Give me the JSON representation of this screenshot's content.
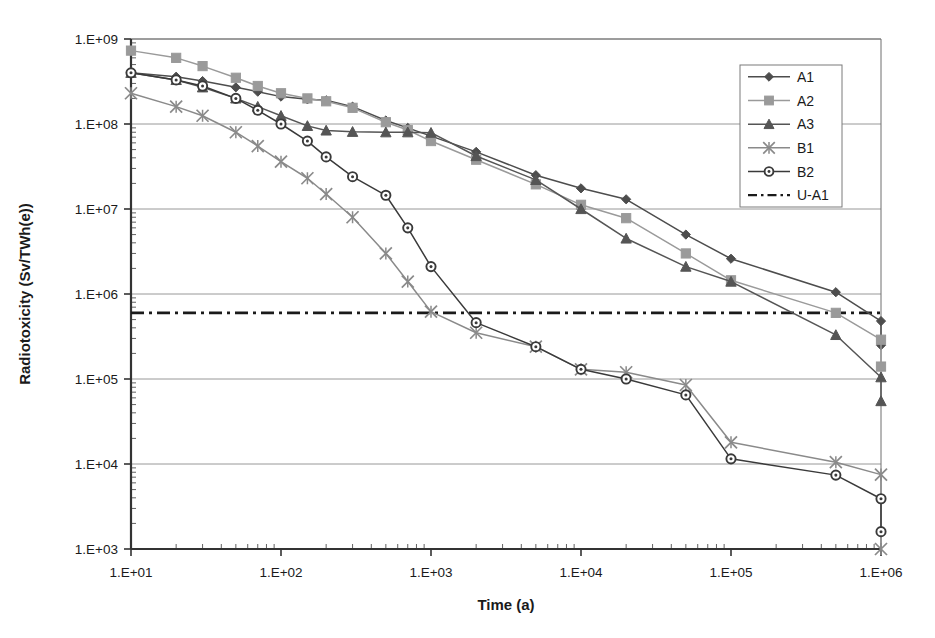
{
  "chart_data": {
    "type": "line",
    "title": "",
    "xlabel": "Time  (a)",
    "ylabel": "Radiotoxicity  (Sv/TWh(e))",
    "xscale": "log",
    "yscale": "log",
    "xlim": [
      10,
      1000000
    ],
    "ylim": [
      1000,
      1000000000
    ],
    "grid": "horizontal-major",
    "legend_position": "top-right-inside",
    "xticklabels": [
      "1.E+01",
      "1.E+02",
      "1.E+03",
      "1.E+04",
      "1.E+05",
      "1.E+06"
    ],
    "xtickvalues": [
      10,
      100,
      1000,
      10000,
      100000,
      1000000
    ],
    "yticklabels": [
      "1.E+03",
      "1.E+04",
      "1.E+05",
      "1.E+06",
      "1.E+07",
      "1.E+08",
      "1.E+09"
    ],
    "ytickvalues": [
      1000,
      10000,
      100000,
      1000000,
      10000000,
      100000000,
      1000000000
    ],
    "series": [
      {
        "name": "A1",
        "marker": "diamond",
        "color": "#4d4d4d",
        "x": [
          10,
          20,
          30,
          50,
          70,
          100,
          150,
          200,
          300,
          500,
          700,
          1000,
          2000,
          5000,
          10000,
          20000,
          50000,
          100000,
          500000,
          1000000
        ],
        "values": [
          400000000.0,
          360000000.0,
          320000000.0,
          270000000.0,
          240000000.0,
          210000000.0,
          195000000.0,
          190000000.0,
          160000000.0,
          110000000.0,
          90000000.0,
          72000000.0,
          47000000.0,
          25000000.0,
          17500000.0,
          13000000.0,
          5000000.0,
          2600000.0,
          1050000.0,
          480000.0
        ],
        "end_value": 250000.0
      },
      {
        "name": "A2",
        "marker": "square",
        "color": "#9a9a9a",
        "x": [
          10,
          20,
          30,
          50,
          70,
          100,
          150,
          200,
          300,
          500,
          700,
          1000,
          2000,
          5000,
          10000,
          20000,
          50000,
          100000,
          500000,
          1000000
        ],
        "values": [
          730000000.0,
          600000000.0,
          480000000.0,
          350000000.0,
          280000000.0,
          230000000.0,
          200000000.0,
          185000000.0,
          155000000.0,
          105000000.0,
          85000000.0,
          63000000.0,
          38000000.0,
          19500000.0,
          11200000.0,
          7800000.0,
          3000000.0,
          1450000.0,
          600000.0,
          290000.0
        ],
        "end_value": 140000.0
      },
      {
        "name": "A3",
        "marker": "triangle",
        "color": "#555555",
        "x": [
          10,
          20,
          30,
          50,
          70,
          100,
          150,
          200,
          300,
          500,
          700,
          1000,
          2000,
          5000,
          10000,
          20000,
          50000,
          100000,
          500000,
          1000000
        ],
        "values": [
          400000000.0,
          330000000.0,
          270000000.0,
          200000000.0,
          160000000.0,
          125000000.0,
          95000000.0,
          84000000.0,
          81000000.0,
          80000000.0,
          80000000.0,
          79000000.0,
          42000000.0,
          22000000.0,
          10000000.0,
          4500000.0,
          2100000.0,
          1400000.0,
          330000.0,
          105000.0
        ],
        "end_value": 55000.0
      },
      {
        "name": "B1",
        "marker": "asterisk",
        "color": "#8a8a8a",
        "x": [
          10,
          20,
          30,
          50,
          70,
          100,
          150,
          200,
          300,
          500,
          700,
          1000,
          2000,
          5000,
          10000,
          20000,
          50000,
          100000,
          500000,
          1000000
        ],
        "values": [
          230000000.0,
          160000000.0,
          125000000.0,
          80000000.0,
          55000000.0,
          36000000.0,
          23000000.0,
          15000000.0,
          8000000.0,
          3000000.0,
          1400000.0,
          620000.0,
          350000.0,
          240000.0,
          130000.0,
          120000.0,
          85000.0,
          18000.0,
          10500.0,
          7500.0
        ],
        "end_value": 1000.0
      },
      {
        "name": "B2",
        "marker": "circle",
        "color": "#3a3a3a",
        "x": [
          10,
          20,
          30,
          50,
          70,
          100,
          150,
          200,
          300,
          500,
          700,
          1000,
          2000,
          5000,
          10000,
          20000,
          50000,
          100000,
          500000,
          1000000
        ],
        "values": [
          400000000.0,
          330000000.0,
          280000000.0,
          200000000.0,
          145000000.0,
          100000000.0,
          63000000.0,
          41000000.0,
          24000000.0,
          14500000.0,
          6000000.0,
          2100000.0,
          460000.0,
          240000.0,
          130000.0,
          100000.0,
          65000.0,
          11500.0,
          7400.0,
          3900.0
        ],
        "end_value": 1600.0
      }
    ],
    "reference_lines": [
      {
        "name": "U-A1",
        "style": "dash-dot",
        "color": "#1a1a1a",
        "orientation": "horizontal",
        "value": 600000.0
      }
    ],
    "legend": [
      {
        "label": "A1",
        "marker": "diamond",
        "color": "#4d4d4d"
      },
      {
        "label": "A2",
        "marker": "square",
        "color": "#9a9a9a"
      },
      {
        "label": "A3",
        "marker": "triangle",
        "color": "#555555"
      },
      {
        "label": "B1",
        "marker": "asterisk",
        "color": "#8a8a8a"
      },
      {
        "label": "B2",
        "marker": "circle",
        "color": "#3a3a3a"
      },
      {
        "label": "U-A1",
        "marker": "dashdot",
        "color": "#1a1a1a"
      }
    ]
  },
  "plot_geometry": {
    "left": 131,
    "right": 881,
    "top": 39,
    "bottom": 549,
    "legend_box": {
      "x": 740,
      "y": 65,
      "width": 102,
      "height": 142
    }
  }
}
